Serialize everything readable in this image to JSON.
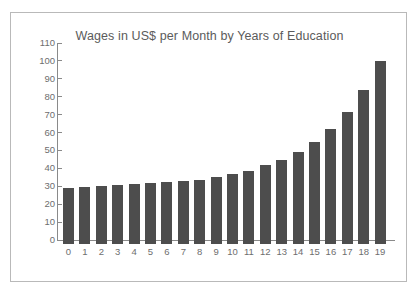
{
  "chart_data": {
    "type": "bar",
    "title": "Wages in US$ per Month by Years of Education",
    "xlabel": "",
    "ylabel": "",
    "categories": [
      "0",
      "1",
      "2",
      "3",
      "4",
      "5",
      "6",
      "7",
      "8",
      "9",
      "10",
      "11",
      "12",
      "13",
      "14",
      "15",
      "16",
      "17",
      "18",
      "19"
    ],
    "values": [
      31.5,
      32,
      32.5,
      33,
      33.5,
      34,
      34.5,
      35,
      36,
      37.5,
      39,
      41,
      44,
      47,
      51.5,
      57,
      64,
      73.5,
      86,
      102
    ],
    "ylim": [
      0,
      110
    ],
    "ytick_values": [
      0,
      10,
      20,
      30,
      40,
      50,
      60,
      70,
      80,
      90,
      100,
      110
    ],
    "ytick_labels": [
      "0",
      "10",
      "20",
      "30",
      "40",
      "50",
      "60",
      "70",
      "80",
      "90",
      "100",
      "110"
    ],
    "grid": false,
    "legend": null,
    "bar_color": "#4d4d4d",
    "axis_color": "#8a8a8a",
    "text_color": "#6e6e6e",
    "title_color": "#5b5b5b",
    "frame_color": "#b9b9b9",
    "background": "#ffffff"
  }
}
